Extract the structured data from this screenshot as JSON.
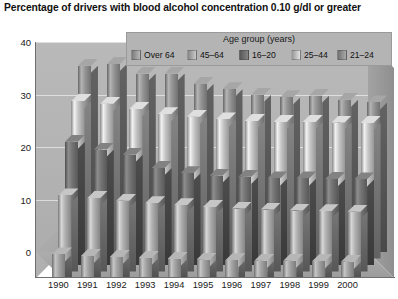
{
  "title": "Percentage of drivers with blood alcohol concentration 0.10 g/dl or greater",
  "legend": {
    "title": "Age group (years)",
    "items": [
      {
        "label": "Over 64",
        "color": "#9a9a9a"
      },
      {
        "label": "45–64",
        "color": "#a8a8a8"
      },
      {
        "label": "16–20",
        "color": "#6e6e6e"
      },
      {
        "label": "25–44",
        "color": "#bdbdbd"
      },
      {
        "label": "21–24",
        "color": "#8d8d8d"
      }
    ]
  },
  "axis": {
    "y_ticks": [
      "0",
      "10",
      "20",
      "30",
      "40"
    ],
    "x_labels": [
      "1990",
      "1991",
      "1992",
      "1993",
      "1994",
      "1995",
      "1996",
      "1997",
      "1998",
      "1999",
      "2000"
    ]
  },
  "chart_data": {
    "type": "bar",
    "title": "Percentage of drivers with blood alcohol concentration 0.10 g/dl or greater",
    "xlabel": "",
    "ylabel": "",
    "ylim": [
      0,
      40
    ],
    "yticks": [
      0,
      10,
      20,
      30,
      40
    ],
    "grid": true,
    "legend_title": "Age group (years)",
    "legend_position": "top",
    "projection": "3d-depth-rows",
    "categories": [
      "1990",
      "1991",
      "1992",
      "1993",
      "1994",
      "1995",
      "1996",
      "1997",
      "1998",
      "1999",
      "2000"
    ],
    "series": [
      {
        "name": "Over 64",
        "depth": 0,
        "color": "#9a9a9a",
        "values": [
          4.5,
          4.2,
          4.0,
          3.8,
          3.6,
          3.5,
          3.4,
          3.3,
          3.3,
          3.2,
          3.1
        ]
      },
      {
        "name": "45–64",
        "depth": 1,
        "color": "#a8a8a8",
        "values": [
          14.5,
          14.0,
          13.5,
          13.0,
          12.6,
          12.3,
          12.0,
          11.8,
          11.6,
          11.5,
          11.4
        ]
      },
      {
        "name": "16–20",
        "depth": 2,
        "color": "#6e6e6e",
        "values": [
          23.5,
          22.0,
          21.0,
          18.5,
          17.5,
          17.0,
          16.8,
          16.5,
          16.5,
          16.4,
          16.3
        ]
      },
      {
        "name": "25–44",
        "depth": 3,
        "color": "#bdbdbd",
        "values": [
          30.0,
          29.5,
          28.5,
          27.5,
          27.0,
          26.5,
          26.2,
          26.0,
          26.0,
          25.9,
          25.8
        ]
      },
      {
        "name": "21–24",
        "depth": 4,
        "color": "#8d8d8d",
        "values": [
          35.5,
          35.8,
          34.0,
          34.0,
          32.0,
          31.0,
          30.0,
          29.5,
          29.8,
          29.0,
          28.5
        ]
      }
    ]
  }
}
